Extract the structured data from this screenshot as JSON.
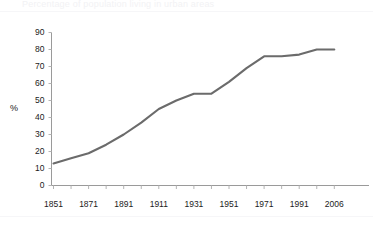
{
  "figure": {
    "clipped_title_remnant": "Percentage of population living in urban areas",
    "axis_label_y": "%",
    "line_color": "#6b6b6b",
    "axis_color": "#9a9a9a",
    "tick_color": "#b4b4b4",
    "text_color": "#1b1b1b",
    "background": "#ffffff"
  },
  "chart_data": {
    "type": "line",
    "title": "",
    "xlabel": "",
    "ylabel": "%",
    "ylim": [
      0,
      90
    ],
    "ytick_values": [
      0,
      10,
      20,
      30,
      40,
      50,
      60,
      70,
      80,
      90
    ],
    "ytick_labels": [
      "0",
      "10",
      "20",
      "30",
      "40",
      "50",
      "60",
      "70",
      "80",
      "90"
    ],
    "xtick_labels": [
      "1851",
      "1871",
      "1891",
      "1911",
      "1931",
      "1951",
      "1971",
      "1991",
      "2006"
    ],
    "grid": false,
    "legend": false,
    "x": [
      1851,
      1861,
      1871,
      1881,
      1891,
      1901,
      1911,
      1921,
      1931,
      1941,
      1951,
      1961,
      1971,
      1981,
      1991,
      2001,
      2006
    ],
    "values": [
      13,
      16,
      19,
      24,
      30,
      37,
      45,
      50,
      54,
      54,
      61,
      69,
      76,
      76,
      77,
      80,
      80
    ],
    "series": [
      {
        "name": "urban population share",
        "values": [
          13,
          16,
          19,
          24,
          30,
          37,
          45,
          50,
          54,
          54,
          61,
          69,
          76,
          76,
          77,
          80,
          80
        ]
      }
    ]
  }
}
